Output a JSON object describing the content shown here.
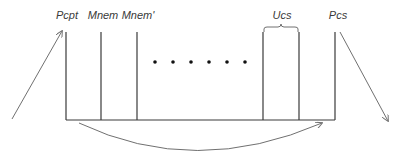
{
  "diagram": {
    "labels": {
      "pcpt": "Pcpt",
      "mnem": "Mnem",
      "mnem_prime": "Mnem'",
      "ucs": "Ucs",
      "pcs": "Pcs"
    },
    "colors": {
      "line": "#3a3a3a",
      "arrow": "#707070",
      "dot": "#111111"
    },
    "ellipsis_dot_count": 6
  }
}
